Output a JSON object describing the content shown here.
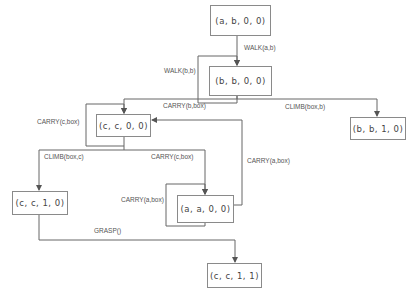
{
  "diagram": {
    "nodes": [
      {
        "id": "n_abb00",
        "label": "(a, b, 0, 0)"
      },
      {
        "id": "n_bb00",
        "label": "(b, b, 0, 0)"
      },
      {
        "id": "n_cc00",
        "label": "(c, c, 0, 0)"
      },
      {
        "id": "n_bb10",
        "label": "(b, b, 1, 0)"
      },
      {
        "id": "n_cc10",
        "label": "(c, c, 1, 0)"
      },
      {
        "id": "n_aa00",
        "label": "(a, a, 0, 0)"
      },
      {
        "id": "n_cc11",
        "label": "(c, c, 1, 1)"
      }
    ],
    "edges": [
      {
        "from": "(a, b, 0, 0)",
        "to": "(b, b, 0, 0)",
        "label": "WALK(a,b)"
      },
      {
        "from": "(b, b, 0, 0)",
        "to": "(b, b, 0, 0)",
        "label": "WALK(b,b)"
      },
      {
        "from": "(b, b, 0, 0)",
        "to": "(c, c, 0, 0)",
        "label": "CARRY(b,box)"
      },
      {
        "from": "(b, b, 0, 0)",
        "to": "(b, b, 1, 0)",
        "label": "CLIMB(box,b)"
      },
      {
        "from": "(c, c, 0, 0)",
        "to": "(c, c, 0, 0)",
        "label": "CARRY(c,box)"
      },
      {
        "from": "(c, c, 0, 0)",
        "to": "(c, c, 1, 0)",
        "label": "CLIMB(box,c)"
      },
      {
        "from": "(c, c, 0, 0)",
        "to": "(a, a, 0, 0)",
        "label": "CARRY(c,box)"
      },
      {
        "from": "(a, a, 0, 0)",
        "to": "(c, c, 0, 0)",
        "label": "CARRY(a,box)"
      },
      {
        "from": "(a, a, 0, 0)",
        "to": "(a, a, 0, 0)",
        "label": "CARRY(a,box)"
      },
      {
        "from": "(c, c, 1, 0)",
        "to": "(c, c, 1, 1)",
        "label": "GRASP()"
      }
    ]
  }
}
